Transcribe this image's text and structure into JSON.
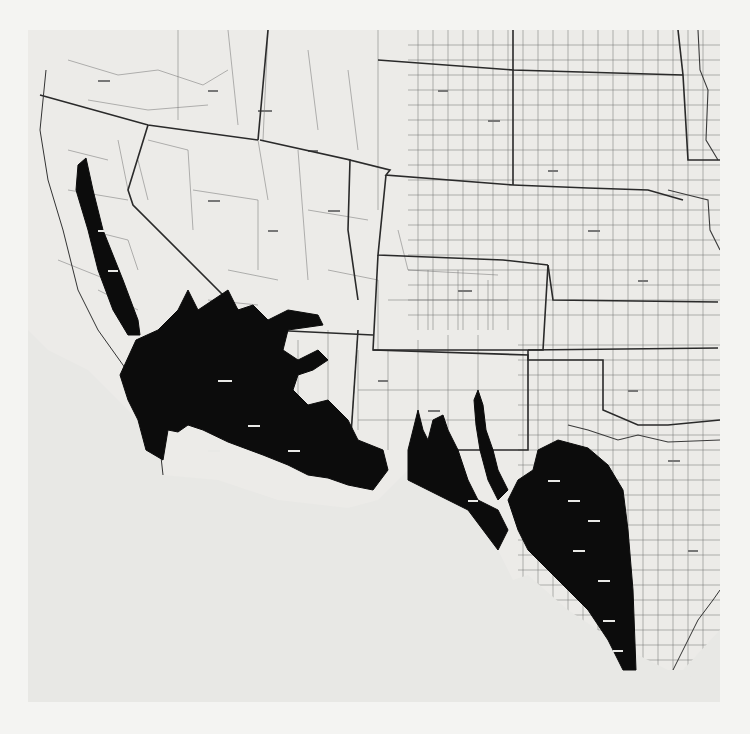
{
  "map": {
    "type": "distribution-map",
    "style": "black-and-white county outline map",
    "region": "Western and south-central United States",
    "extent_description": "California and Oregon border east to Minnesota/Iowa/Missouri; south to Texas Gulf coast",
    "shaded_range": {
      "fill_color": "#0c0c0c",
      "meaning_visible": false,
      "areas": [
        "California Central Valley",
        "Southern California coast and mountains",
        "Southern Nevada / Colorado River corridor",
        "Southern and western Arizona",
        "Southern New Mexico (Rio Grande, Pecos valleys)",
        "Western and south Texas"
      ]
    },
    "colors": {
      "background": "#f4f4f2",
      "land": "#ecebe8",
      "state_lines": "#2a2a2a",
      "county_lines": "#6f6f6f",
      "range": "#0c0c0c",
      "ocean_blank": "#e8e8e5"
    },
    "states_visible": [
      "Washington",
      "Oregon",
      "California",
      "Idaho",
      "Nevada",
      "Utah",
      "Arizona",
      "Montana",
      "Wyoming",
      "Colorado",
      "New Mexico",
      "North Dakota",
      "South Dakota",
      "Nebraska",
      "Kansas",
      "Oklahoma",
      "Texas",
      "Minnesota",
      "Iowa",
      "Missouri"
    ],
    "legend": null,
    "title": null,
    "county_labels_legible": false
  },
  "caption": {
    "bleed_through_text": ""
  }
}
